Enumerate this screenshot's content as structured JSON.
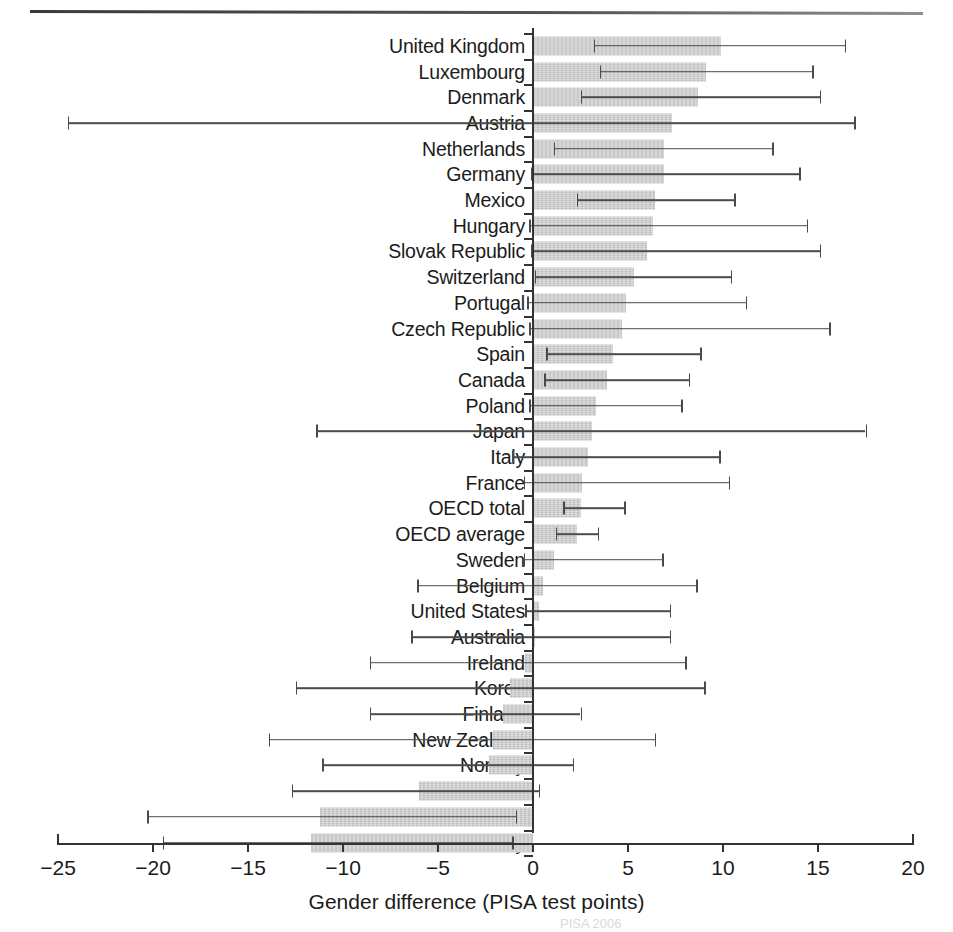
{
  "figure": {
    "xaxis_title": "Gender difference (PISA test points)",
    "footer_note": "                 PISA 2006"
  },
  "chart_data": {
    "type": "bar",
    "orientation": "horizontal",
    "title": "",
    "subtitle": "",
    "xlabel": "Gender difference (PISA test points)",
    "ylabel": "",
    "xlim": [
      -25,
      20
    ],
    "xticks": [
      -25,
      -20,
      -15,
      -10,
      -5,
      0,
      5,
      10,
      15,
      20
    ],
    "xticklabels": [
      "−25",
      "−20",
      "−15",
      "−10",
      "−5",
      "0",
      "5",
      "10",
      "15",
      "20"
    ],
    "grid": false,
    "legend": null,
    "error_bars": "confidence interval (low/high)",
    "categories": [
      "United Kingdom",
      "Luxembourg",
      "Denmark",
      "Austria",
      "Netherlands",
      "Germany",
      "Mexico",
      "Hungary",
      "Slovak Republic",
      "Switzerland",
      "Portugal",
      "Czech Republic",
      "Spain",
      "Canada",
      "Poland",
      "Japan",
      "Italy",
      "France",
      "OECD total",
      "OECD average",
      "Sweden",
      "Belgium",
      "United States",
      "Australia",
      "Ireland",
      "Korea",
      "Finland",
      "New Zealand",
      "Norway",
      "Iceland",
      "Greece",
      "Turkey"
    ],
    "values": [
      9.9,
      9.1,
      8.7,
      7.3,
      6.9,
      6.9,
      6.4,
      6.3,
      6.0,
      5.3,
      4.9,
      4.7,
      4.2,
      3.9,
      3.3,
      3.1,
      2.9,
      2.6,
      2.5,
      2.3,
      1.1,
      0.5,
      0.3,
      0.0,
      -0.4,
      -1.2,
      -1.6,
      -2.1,
      -2.3,
      -6.0,
      -11.2,
      -11.7
    ],
    "ci_low": [
      3.2,
      3.5,
      2.5,
      -24.5,
      1.1,
      -0.1,
      2.3,
      -0.2,
      -0.1,
      0.1,
      -0.3,
      -0.2,
      0.7,
      0.6,
      -0.2,
      -11.4,
      -1.1,
      -0.5,
      1.6,
      1.2,
      -0.5,
      -6.1,
      -0.4,
      -6.4,
      -8.6,
      -12.5,
      -8.6,
      -13.9,
      -11.1,
      -12.7,
      -20.3,
      -19.5
    ],
    "ci_high": [
      16.4,
      14.7,
      15.1,
      16.9,
      12.6,
      14.0,
      10.6,
      14.4,
      15.1,
      10.4,
      11.2,
      15.6,
      8.8,
      8.2,
      7.8,
      17.5,
      9.8,
      10.3,
      4.8,
      3.4,
      6.8,
      8.6,
      7.2,
      7.2,
      8.0,
      9.0,
      2.5,
      6.4,
      2.1,
      0.3,
      -0.9,
      -1.1
    ]
  }
}
